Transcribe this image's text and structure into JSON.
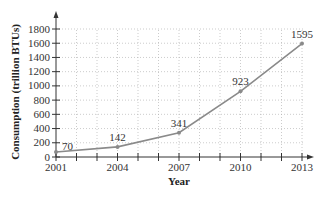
{
  "chart_data": {
    "type": "line",
    "title": "",
    "xlabel": "Year",
    "ylabel": "Consumption (trillion BTUs)",
    "x": [
      2001,
      2004,
      2007,
      2010,
      2013
    ],
    "series": [
      {
        "name": "Consumption",
        "values": [
          70,
          142,
          341,
          923,
          1595
        ]
      }
    ],
    "data_labels": [
      "70",
      "142",
      "341",
      "923",
      "1595"
    ],
    "x_tick_labels": [
      "2001",
      "2004",
      "2007",
      "2010",
      "2013"
    ],
    "y_ticks": [
      0,
      200,
      400,
      600,
      800,
      1000,
      1200,
      1400,
      1600,
      1800
    ],
    "y_tick_labels": [
      "0",
      "200",
      "400",
      "600",
      "800",
      "1000",
      "1200",
      "1400",
      "1600",
      "1800"
    ],
    "xlim": [
      2001,
      2013
    ],
    "ylim": [
      0,
      1800
    ],
    "grid": true,
    "legend": "none"
  },
  "colors": {
    "line": "#8a8a8a",
    "axis": "#333333",
    "grid": "#aaaaaa"
  }
}
